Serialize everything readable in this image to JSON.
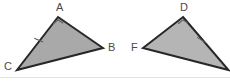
{
  "figure": {
    "background_color": "#ffffff",
    "width": 230,
    "height": 83,
    "baseline_rule_color": "#e3e3e3",
    "stroke_color": "#272727",
    "mark_color": "#5a5a5a",
    "label_color": "#4a4a4a",
    "label_font_size": 11
  },
  "shapes": [
    {
      "name": "triangle-abc",
      "fill_color": "#a9a9a9",
      "stroke_color": "#272727",
      "stroke_width": 2,
      "points": "58,17 103,48 17,70",
      "vertices": [
        {
          "id": "A",
          "label": "A",
          "x": 58,
          "y": 17,
          "label_x": 56,
          "label_y": 2
        },
        {
          "id": "B",
          "label": "B",
          "x": 103,
          "y": 48,
          "label_x": 108,
          "label_y": 42
        },
        {
          "id": "C",
          "label": "C",
          "x": 17,
          "y": 70,
          "label_x": 4,
          "label_y": 62
        }
      ],
      "angle_mark": {
        "at": "A",
        "d": "M 53.5,23.5 L 58,19.5 L 63,23"
      },
      "side_tick": {
        "on": "C-A",
        "d": "M 34.5,38.5 L 43,41.5"
      }
    },
    {
      "name": "triangle-def",
      "fill_color": "#b5b5b5",
      "stroke_color": "#272727",
      "stroke_width": 2,
      "points": "183,17 228,70 143,48",
      "vertices": [
        {
          "id": "D",
          "label": "D",
          "x": 183,
          "y": 17,
          "label_x": 180,
          "label_y": 2
        },
        {
          "id": "F",
          "label": "F",
          "x": 143,
          "y": 48,
          "label_x": 130,
          "label_y": 42
        },
        {
          "id": "E",
          "label": "",
          "x": 228,
          "y": 70,
          "label_x": 0,
          "label_y": 0
        }
      ],
      "angle_mark": {
        "at": "D",
        "d": "M 178.5,23.5 L 183,19.5 L 188,23"
      },
      "side_tick": {
        "on": "D-E",
        "d": "M 198,38 L 206,42.5"
      }
    }
  ],
  "labels": {
    "a": "A",
    "b": "B",
    "c": "C",
    "d": "D",
    "f": "F"
  }
}
